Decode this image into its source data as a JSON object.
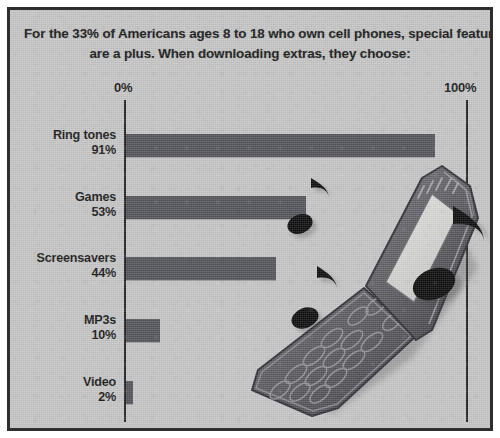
{
  "headline": {
    "line1": "For the 33% of Americans ages 8 to 18 who own cell phones, special features",
    "line2": "are a plus. When downloading extras, they choose:"
  },
  "axis": {
    "start_label": "0%",
    "end_label": "100%"
  },
  "colors": {
    "background": "#c6c6c6",
    "border": "#2e2e2e",
    "bar": "#55565c",
    "axis": "#232323",
    "text": "#1b1b1b",
    "note": "#101010"
  },
  "chart_data": {
    "type": "bar",
    "orientation": "horizontal",
    "title": "For the 33% of Americans ages 8 to 18 who own cell phones, special features are a plus. When downloading extras, they choose:",
    "xlabel": "",
    "ylabel": "",
    "xlim": [
      0,
      100
    ],
    "grid": false,
    "legend": false,
    "tick_labels": [
      "0%",
      "100%"
    ],
    "categories": [
      "Ring tones",
      "Games",
      "Screensavers",
      "MP3s",
      "Video"
    ],
    "values": [
      91,
      53,
      44,
      10,
      2
    ],
    "value_labels": [
      "91%",
      "53%",
      "44%",
      "10%",
      "2%"
    ],
    "series": [
      {
        "name": "Share who download",
        "values": [
          91,
          53,
          44,
          10,
          2
        ]
      }
    ]
  },
  "illustration": {
    "subject": "open-flip-phone",
    "notes": [
      "music-note-small",
      "music-note-medium",
      "music-note-large"
    ]
  }
}
